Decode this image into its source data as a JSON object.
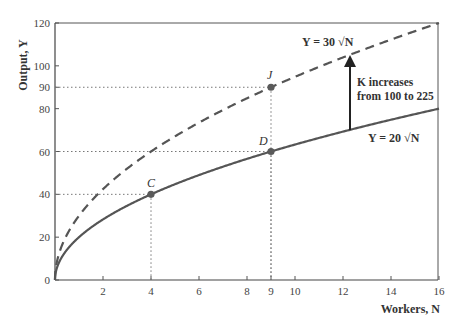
{
  "chart_data": {
    "type": "line",
    "title": "",
    "xlabel": "Workers, N",
    "ylabel": "Output, Y",
    "xlim": [
      0,
      16
    ],
    "ylim": [
      0,
      120
    ],
    "x_ticks": [
      2,
      4,
      6,
      8,
      9,
      10,
      12,
      14,
      16
    ],
    "y_ticks": [
      0,
      20,
      40,
      60,
      80,
      90,
      100,
      120
    ],
    "grid": false,
    "series": [
      {
        "name": "Y = 20 √N",
        "style": "solid",
        "x": [
          0,
          1,
          4,
          9,
          16
        ],
        "values": [
          0,
          20,
          40,
          60,
          80
        ]
      },
      {
        "name": "Y = 30 √N",
        "style": "dashed",
        "x": [
          0,
          1,
          4,
          9,
          16
        ],
        "values": [
          0,
          30,
          60,
          90,
          120
        ]
      }
    ],
    "points": [
      {
        "label": "C",
        "x": 4,
        "y": 40
      },
      {
        "label": "D",
        "x": 9,
        "y": 60
      },
      {
        "label": "J",
        "x": 9,
        "y": 90
      }
    ],
    "annotations": [
      {
        "text": "K increases from 100 to 225",
        "type": "arrow",
        "from": [
          12.3,
          70
        ],
        "to": [
          12.3,
          104
        ]
      }
    ],
    "colors": {
      "curve": "#555555",
      "point": "#5a5a5a",
      "axis": "#444444",
      "guide": "#777777"
    }
  },
  "labels": {
    "ylabel": "Output, Y",
    "xlabel": "Workers, N",
    "curve_low": "Y = 20 √N",
    "curve_high": "Y = 30 √N",
    "ann_line1": "K increases",
    "ann_line2": "from 100 to 225",
    "point_c": "C",
    "point_d": "D",
    "point_j": "J"
  }
}
